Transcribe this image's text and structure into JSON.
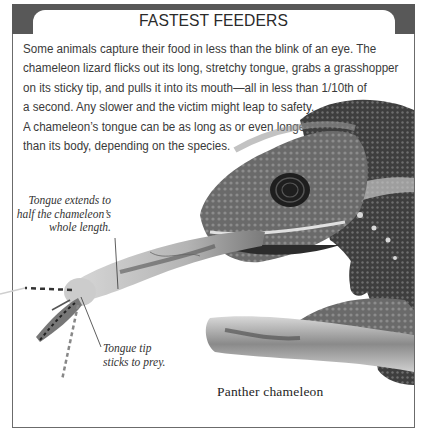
{
  "panel": {
    "title": "FASTEST FEEDERS",
    "body_lines": [
      "Some animals capture their food in less than the blink of an eye. The",
      "chameleon lizard flicks out its long, stretchy tongue, grabs a grasshopper",
      "on its sticky tip, and pulls it into its mouth—all in less than 1/10th of",
      "a second. Any slower and the victim might leap to safety.",
      "A chameleon’s tongue can be as long as or even longer",
      "than its body, depending on the species."
    ]
  },
  "illustration": {
    "subject": "panther-chameleon-catching-grasshopper",
    "caption": "Panther chameleon",
    "callouts": [
      {
        "lines": [
          "Tongue extends to",
          "half the chameleon’s",
          "whole length."
        ]
      },
      {
        "lines": [
          "Tongue tip",
          "sticks to prey."
        ]
      }
    ]
  },
  "colors": {
    "header_band": "#585858",
    "frame_border": "#6b6b6b",
    "text": "#3a3a3a",
    "background": "#ffffff"
  }
}
